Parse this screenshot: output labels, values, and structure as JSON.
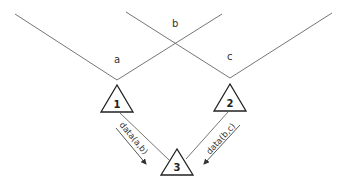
{
  "diagram": {
    "lines": {
      "a_label": "a",
      "b_label": "b",
      "c_label": "c"
    },
    "nodes": [
      {
        "id": "1",
        "label": "1"
      },
      {
        "id": "2",
        "label": "2"
      },
      {
        "id": "3",
        "label": "3"
      }
    ],
    "edges": [
      {
        "from": "1",
        "to": "3",
        "label": "data(a,b)"
      },
      {
        "from": "2",
        "to": "3",
        "label": "data(b,c)"
      }
    ],
    "colors": {
      "line": "#555555",
      "text": "#333333",
      "background": "#ffffff"
    }
  }
}
